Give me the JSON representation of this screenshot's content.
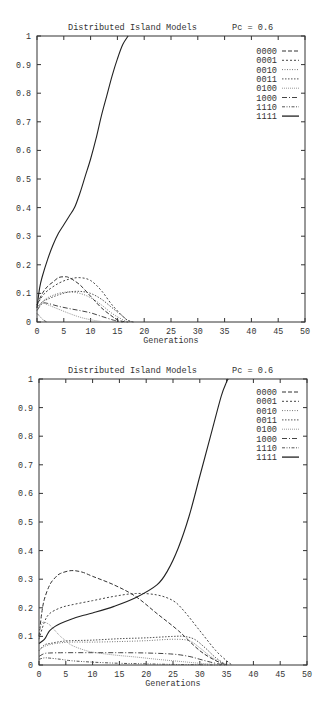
{
  "chart_data": [
    {
      "type": "line",
      "title": "Distributed Island Models",
      "subtitle": "Pc = 0.6",
      "xlabel": "Generations",
      "ylabel": "",
      "xlim": [
        0,
        50
      ],
      "ylim": [
        0,
        1
      ],
      "xticks": [
        0,
        5,
        10,
        15,
        20,
        25,
        30,
        35,
        40,
        45,
        50
      ],
      "yticks": [
        0,
        0.1,
        0.2,
        0.3,
        0.4,
        0.5,
        0.6,
        0.7,
        0.8,
        0.9,
        1
      ],
      "ytick_labels": [
        "0",
        "0.1",
        "0.2",
        "0.3",
        "0.4",
        "0.5",
        "0.6",
        "0.7",
        "0.8",
        "0.9",
        "1"
      ],
      "grid": false,
      "legend_position": "upper right",
      "series": [
        {
          "name": "0000",
          "dash": "4,2",
          "color": "#333333",
          "x": [
            0,
            1,
            2,
            3,
            4,
            5,
            6,
            8,
            10,
            12,
            14,
            15,
            16,
            17
          ],
          "y": [
            0.06,
            0.1,
            0.125,
            0.14,
            0.155,
            0.158,
            0.155,
            0.13,
            0.09,
            0.05,
            0.02,
            0.008,
            0.002,
            0
          ]
        },
        {
          "name": "0001",
          "dash": "2,2",
          "color": "#444444",
          "x": [
            0,
            1,
            2,
            4,
            6,
            8,
            10,
            12,
            14,
            16,
            17,
            18
          ],
          "y": [
            0.06,
            0.09,
            0.11,
            0.135,
            0.15,
            0.155,
            0.145,
            0.11,
            0.06,
            0.02,
            0.005,
            0
          ]
        },
        {
          "name": "0010",
          "dash": "1,1.5",
          "color": "#777777",
          "x": [
            0,
            1,
            2,
            4,
            6,
            8,
            10,
            12,
            14,
            16,
            17
          ],
          "y": [
            0.05,
            0.07,
            0.085,
            0.1,
            0.105,
            0.1,
            0.085,
            0.06,
            0.03,
            0.008,
            0
          ]
        },
        {
          "name": "0011",
          "dash": "1.5,1.5",
          "color": "#555555",
          "x": [
            0,
            1,
            2,
            4,
            6,
            8,
            10,
            12,
            14,
            16,
            17,
            18
          ],
          "y": [
            0.05,
            0.07,
            0.08,
            0.095,
            0.105,
            0.107,
            0.1,
            0.08,
            0.05,
            0.02,
            0.005,
            0
          ]
        },
        {
          "name": "0100",
          "dash": "1,1",
          "color": "#999999",
          "x": [
            0,
            1,
            2,
            4,
            6,
            8,
            10,
            12,
            14
          ],
          "y": [
            0.045,
            0.065,
            0.06,
            0.045,
            0.03,
            0.017,
            0.008,
            0.002,
            0
          ]
        },
        {
          "name": "1000",
          "dash": "5,2,1,2",
          "color": "#444444",
          "x": [
            0,
            1,
            2,
            4,
            6,
            8,
            10,
            12,
            14,
            15,
            16
          ],
          "y": [
            0.04,
            0.065,
            0.065,
            0.055,
            0.047,
            0.04,
            0.032,
            0.02,
            0.008,
            0.003,
            0
          ]
        },
        {
          "name": "1110",
          "dash": "3,1.5,1,1.5,1,1.5",
          "color": "#555555",
          "x": [
            0,
            0.5,
            1,
            1.5,
            2
          ],
          "y": [
            0.03,
            0.02,
            0.01,
            0.003,
            0
          ]
        },
        {
          "name": "1111",
          "dash": "",
          "color": "#222222",
          "x": [
            0,
            0.5,
            1,
            2,
            3,
            4,
            5,
            6,
            7,
            8,
            9,
            10,
            11,
            12,
            13,
            14,
            15,
            16,
            17
          ],
          "y": [
            0.05,
            0.12,
            0.16,
            0.22,
            0.27,
            0.31,
            0.34,
            0.37,
            0.4,
            0.45,
            0.51,
            0.57,
            0.64,
            0.72,
            0.79,
            0.86,
            0.92,
            0.97,
            1.0
          ]
        }
      ]
    },
    {
      "type": "line",
      "title": "Distributed Island Models",
      "subtitle": "Pc = 0.6",
      "xlabel": "Generations",
      "ylabel": "",
      "xlim": [
        0,
        50
      ],
      "ylim": [
        0,
        1
      ],
      "xticks": [
        0,
        5,
        10,
        15,
        20,
        25,
        30,
        35,
        40,
        45,
        50
      ],
      "yticks": [
        0,
        0.1,
        0.2,
        0.3,
        0.4,
        0.5,
        0.6,
        0.7,
        0.8,
        0.9,
        1
      ],
      "ytick_labels": [
        "0",
        "0.1",
        "0.2",
        "0.3",
        "0.4",
        "0.5",
        "0.6",
        "0.7",
        "0.8",
        "0.9",
        "1"
      ],
      "grid": false,
      "legend_position": "upper right",
      "series": [
        {
          "name": "0000",
          "dash": "4,2",
          "color": "#333333",
          "x": [
            0,
            0.5,
            1,
            2,
            3,
            4,
            6,
            8,
            10,
            14,
            18,
            22,
            26,
            30,
            33,
            35
          ],
          "y": [
            0.1,
            0.18,
            0.23,
            0.28,
            0.305,
            0.32,
            0.33,
            0.325,
            0.31,
            0.28,
            0.24,
            0.18,
            0.12,
            0.05,
            0.015,
            0
          ]
        },
        {
          "name": "0001",
          "dash": "2,2",
          "color": "#444444",
          "x": [
            0,
            1,
            2,
            4,
            6,
            10,
            14,
            18,
            22,
            25,
            27,
            30,
            33,
            35,
            36
          ],
          "y": [
            0.09,
            0.15,
            0.18,
            0.2,
            0.21,
            0.225,
            0.24,
            0.25,
            0.245,
            0.225,
            0.19,
            0.12,
            0.05,
            0.015,
            0
          ]
        },
        {
          "name": "0010",
          "dash": "1,1.5",
          "color": "#777777",
          "x": [
            0,
            1,
            3,
            6,
            10,
            15,
            20,
            25,
            28,
            30,
            32,
            34,
            35
          ],
          "y": [
            0.05,
            0.065,
            0.075,
            0.08,
            0.08,
            0.082,
            0.085,
            0.09,
            0.085,
            0.06,
            0.03,
            0.008,
            0
          ]
        },
        {
          "name": "0011",
          "dash": "1.5,1.5",
          "color": "#555555",
          "x": [
            0,
            1,
            2,
            4,
            6,
            10,
            15,
            20,
            25,
            27,
            29,
            31,
            33,
            35
          ],
          "y": [
            0.05,
            0.07,
            0.075,
            0.082,
            0.085,
            0.087,
            0.092,
            0.095,
            0.1,
            0.1,
            0.09,
            0.06,
            0.025,
            0
          ]
        },
        {
          "name": "0100",
          "dash": "1,1",
          "color": "#999999",
          "x": [
            0,
            0.5,
            1,
            2,
            3,
            4,
            5,
            6,
            8,
            10,
            14,
            18,
            22,
            26,
            30,
            34
          ],
          "y": [
            0.12,
            0.145,
            0.15,
            0.14,
            0.12,
            0.1,
            0.085,
            0.07,
            0.055,
            0.045,
            0.035,
            0.028,
            0.02,
            0.013,
            0.006,
            0
          ]
        },
        {
          "name": "1000",
          "dash": "5,2,1,2",
          "color": "#444444",
          "x": [
            0,
            1,
            2,
            5,
            10,
            15,
            20,
            25,
            28,
            30,
            32,
            34,
            35
          ],
          "y": [
            0.03,
            0.04,
            0.042,
            0.043,
            0.043,
            0.043,
            0.042,
            0.038,
            0.03,
            0.02,
            0.01,
            0.002,
            0
          ]
        },
        {
          "name": "1110",
          "dash": "3,1.5,1,1.5,1,1.5",
          "color": "#555555",
          "x": [
            0,
            1,
            2,
            4,
            6,
            10,
            15,
            20,
            25,
            30,
            34
          ],
          "y": [
            0.02,
            0.025,
            0.024,
            0.02,
            0.015,
            0.01,
            0.006,
            0.004,
            0.002,
            0.001,
            0
          ]
        },
        {
          "name": "1111",
          "dash": "",
          "color": "#222222",
          "x": [
            0,
            1,
            1.5,
            2,
            3,
            4,
            6,
            8,
            10,
            14,
            18,
            22,
            24,
            26,
            28,
            30,
            32,
            34,
            35,
            35.3
          ],
          "y": [
            0.075,
            0.09,
            0.105,
            0.12,
            0.135,
            0.145,
            0.16,
            0.172,
            0.182,
            0.205,
            0.235,
            0.28,
            0.33,
            0.41,
            0.52,
            0.66,
            0.8,
            0.94,
            0.99,
            1.0
          ]
        }
      ]
    }
  ]
}
